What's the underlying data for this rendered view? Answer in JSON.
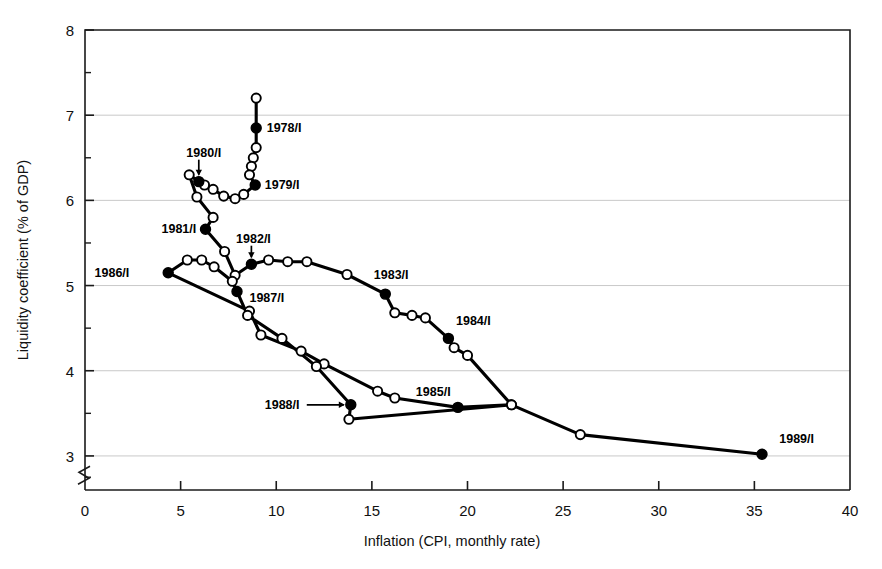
{
  "figure": {
    "background": "#ffffff",
    "frame_color": "#1a1a1a",
    "grid_color": "#c9c9c9",
    "series_color": "#000000"
  },
  "chart_data": {
    "type": "scatter",
    "title": "",
    "subtitle": "",
    "xlabel": "Inflation (CPI, monthly rate)",
    "ylabel": "Liquidity coefficient (% of GDP)",
    "xlim": [
      0,
      40
    ],
    "ylim": [
      2.6,
      8
    ],
    "y_axis_break": true,
    "y_axis_break_value": 2.75,
    "grid": "horizontal-major",
    "legend": "none",
    "x_ticks": [
      0,
      5,
      10,
      15,
      20,
      25,
      30,
      35,
      40
    ],
    "x_tick_labels": [
      "0",
      "5",
      "10",
      "15",
      "20",
      "25",
      "30",
      "35",
      "40"
    ],
    "y_ticks": [
      3,
      4,
      5,
      6,
      7,
      8
    ],
    "y_tick_labels": [
      "3",
      "4",
      "5",
      "6",
      "7",
      "8"
    ],
    "y_minor_ticks": [
      2.75,
      3.5,
      4.5,
      5.5,
      6.5,
      7.5
    ],
    "marker_styles": {
      "filled": "annual first-quarter observation (1978/I ... 1989/I)",
      "open": "intermediate quarterly observation"
    },
    "annotations": [
      {
        "label": "1978/I",
        "x": 9.5,
        "y": 6.85,
        "anchor": "start",
        "arrow": false
      },
      {
        "label": "1979/I",
        "x": 9.4,
        "y": 6.18,
        "anchor": "start",
        "arrow": false
      },
      {
        "label": "1980/I",
        "x": 5.3,
        "y": 6.56,
        "anchor": "start",
        "arrow": true
      },
      {
        "label": "1981/I",
        "x": 4.0,
        "y": 5.66,
        "anchor": "start",
        "arrow": false
      },
      {
        "label": "1982/I",
        "x": 7.9,
        "y": 5.55,
        "anchor": "start",
        "arrow": true
      },
      {
        "label": "1983/I",
        "x": 15.1,
        "y": 5.12,
        "anchor": "start",
        "arrow": false
      },
      {
        "label": "1984/I",
        "x": 19.4,
        "y": 4.58,
        "anchor": "start",
        "arrow": false
      },
      {
        "label": "1985/I",
        "x": 17.3,
        "y": 3.75,
        "anchor": "start",
        "arrow": false
      },
      {
        "label": "1986/I",
        "x": 0.5,
        "y": 5.15,
        "anchor": "start",
        "arrow": false
      },
      {
        "label": "1987/I",
        "x": 8.6,
        "y": 4.85,
        "anchor": "start",
        "arrow": false
      },
      {
        "label": "1988/I",
        "x": 9.4,
        "y": 3.6,
        "anchor": "start",
        "arrow": true
      },
      {
        "label": "1989/I",
        "x": 36.3,
        "y": 3.2,
        "anchor": "start",
        "arrow": false
      }
    ],
    "series": [
      {
        "name": "quarterly trajectory 1978/I-1989/I",
        "points": [
          {
            "x": 8.95,
            "y": 7.2,
            "marker": "open"
          },
          {
            "x": 8.95,
            "y": 6.85,
            "marker": "filled",
            "label": "1978/I"
          },
          {
            "x": 8.95,
            "y": 6.62,
            "marker": "open"
          },
          {
            "x": 8.8,
            "y": 6.5,
            "marker": "open"
          },
          {
            "x": 8.7,
            "y": 6.4,
            "marker": "open"
          },
          {
            "x": 8.6,
            "y": 6.3,
            "marker": "open"
          },
          {
            "x": 8.9,
            "y": 6.18,
            "marker": "filled",
            "label": "1979/I"
          },
          {
            "x": 8.3,
            "y": 6.07,
            "marker": "open"
          },
          {
            "x": 7.85,
            "y": 6.02,
            "marker": "open"
          },
          {
            "x": 7.25,
            "y": 6.05,
            "marker": "open"
          },
          {
            "x": 6.7,
            "y": 6.13,
            "marker": "open"
          },
          {
            "x": 6.25,
            "y": 6.18,
            "marker": "open"
          },
          {
            "x": 5.95,
            "y": 6.22,
            "marker": "filled",
            "label": "1980/I"
          },
          {
            "x": 5.45,
            "y": 6.3,
            "marker": "open"
          },
          {
            "x": 5.85,
            "y": 6.04,
            "marker": "open"
          },
          {
            "x": 6.7,
            "y": 5.8,
            "marker": "open"
          },
          {
            "x": 6.3,
            "y": 5.66,
            "marker": "filled",
            "label": "1981/I"
          },
          {
            "x": 7.3,
            "y": 5.4,
            "marker": "open"
          },
          {
            "x": 7.85,
            "y": 5.12,
            "marker": "open"
          },
          {
            "x": 8.7,
            "y": 5.25,
            "marker": "filled",
            "label": "1982/I"
          },
          {
            "x": 9.6,
            "y": 5.3,
            "marker": "open"
          },
          {
            "x": 10.6,
            "y": 5.28,
            "marker": "open"
          },
          {
            "x": 11.6,
            "y": 5.28,
            "marker": "open"
          },
          {
            "x": 13.7,
            "y": 5.13,
            "marker": "open"
          },
          {
            "x": 15.7,
            "y": 4.9,
            "marker": "filled",
            "label": "1983/I"
          },
          {
            "x": 16.2,
            "y": 4.68,
            "marker": "open"
          },
          {
            "x": 17.1,
            "y": 4.65,
            "marker": "open"
          },
          {
            "x": 17.8,
            "y": 4.62,
            "marker": "open"
          },
          {
            "x": 19.0,
            "y": 4.38,
            "marker": "filled",
            "label": "1984/I"
          },
          {
            "x": 19.3,
            "y": 4.27,
            "marker": "open"
          },
          {
            "x": 20.0,
            "y": 4.18,
            "marker": "open"
          },
          {
            "x": 22.3,
            "y": 3.6,
            "marker": "open"
          },
          {
            "x": 19.5,
            "y": 3.57,
            "marker": "filled",
            "label": "1985/I"
          },
          {
            "x": 16.2,
            "y": 3.68,
            "marker": "open"
          },
          {
            "x": 15.3,
            "y": 3.76,
            "marker": "open"
          },
          {
            "x": 12.5,
            "y": 4.08,
            "marker": "open"
          },
          {
            "x": 11.3,
            "y": 4.23,
            "marker": "open"
          },
          {
            "x": 9.2,
            "y": 4.42,
            "marker": "open"
          },
          {
            "x": 8.6,
            "y": 4.7,
            "marker": "open"
          },
          {
            "x": 4.35,
            "y": 5.15,
            "marker": "filled",
            "label": "1986/I"
          },
          {
            "x": 5.35,
            "y": 5.3,
            "marker": "open"
          },
          {
            "x": 6.1,
            "y": 5.3,
            "marker": "open"
          },
          {
            "x": 6.75,
            "y": 5.22,
            "marker": "open"
          },
          {
            "x": 7.7,
            "y": 5.05,
            "marker": "open"
          },
          {
            "x": 7.95,
            "y": 4.93,
            "marker": "filled",
            "label": "1987/I"
          },
          {
            "x": 8.5,
            "y": 4.65,
            "marker": "open"
          },
          {
            "x": 10.3,
            "y": 4.38,
            "marker": "open"
          },
          {
            "x": 12.1,
            "y": 4.05,
            "marker": "open"
          },
          {
            "x": 13.9,
            "y": 3.6,
            "marker": "filled",
            "label": "1988/I"
          },
          {
            "x": 13.8,
            "y": 3.43,
            "marker": "open"
          },
          {
            "x": 22.3,
            "y": 3.6,
            "marker": "open"
          },
          {
            "x": 25.9,
            "y": 3.25,
            "marker": "open"
          },
          {
            "x": 35.4,
            "y": 3.02,
            "marker": "filled",
            "label": "1989/I"
          }
        ]
      }
    ]
  }
}
